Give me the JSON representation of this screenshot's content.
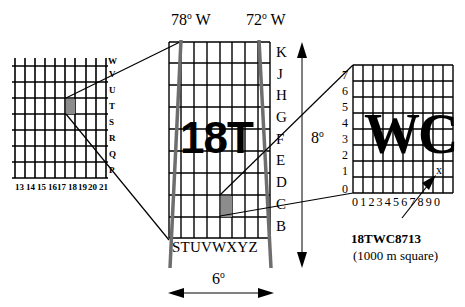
{
  "left_grid": {
    "row_labels": [
      "W",
      "V",
      "U",
      "T",
      "S",
      "R",
      "Q",
      "P"
    ],
    "col_labels": [
      "13",
      "14",
      "15",
      "16",
      "17",
      "18",
      "19",
      "20",
      "21"
    ],
    "shaded_cell": {
      "col": "18",
      "row": "T"
    }
  },
  "zone": {
    "label": "18T",
    "west_meridian": "78",
    "east_meridian": "72",
    "meridian_suffix": " W",
    "degree_mark": "o",
    "row_labels": [
      "K",
      "J",
      "H",
      "G",
      "F",
      "E",
      "D",
      "C",
      "B"
    ],
    "col_labels": "STUVWXYZ",
    "height_label": "8",
    "width_label": "6"
  },
  "square": {
    "label": "WC",
    "row_labels": [
      "7",
      "6",
      "5",
      "4",
      "3",
      "2",
      "1",
      "0"
    ],
    "col_labels": "0 1 2 3 4 5 6 7 8 9 0",
    "marker": "x"
  },
  "annotation": {
    "reference": "18TWC8713",
    "caption": "(1000 m square)"
  },
  "colors": {
    "line": "#000000",
    "meridian": "#6e6e6e",
    "shade": "#8c8c8c"
  }
}
